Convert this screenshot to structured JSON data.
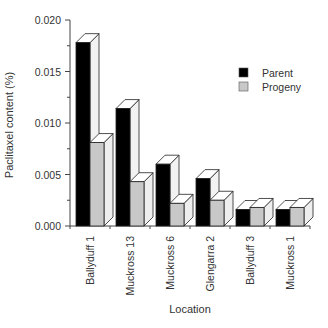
{
  "chart_data": {
    "type": "bar",
    "title": "",
    "xlabel": "Location",
    "ylabel": "Paclitaxel content (%)",
    "ylim": [
      0.0,
      0.02
    ],
    "yticks": [
      "0.000",
      "0.005",
      "0.010",
      "0.015",
      "0.020"
    ],
    "ytick_values": [
      0.0,
      0.005,
      0.01,
      0.015,
      0.02
    ],
    "grid": false,
    "style": "3d-bar",
    "legend_position": "upper right",
    "categories": [
      "Ballyduff 1",
      "Muckross 13",
      "Muckross 6",
      "Glengarra 2",
      "Ballyduff 3",
      "Muckross 1"
    ],
    "series": [
      {
        "name": "Parent",
        "color": "#000000",
        "values": [
          0.0178,
          0.0114,
          0.006,
          0.0046,
          0.0016,
          0.0016
        ]
      },
      {
        "name": "Progeny",
        "color": "#c8c8c8",
        "values": [
          0.0081,
          0.0043,
          0.0022,
          0.0025,
          0.0018,
          0.0018
        ]
      }
    ]
  },
  "legend": {
    "items": [
      {
        "label": "Parent",
        "color": "#000000"
      },
      {
        "label": "Progeny",
        "color": "#c8c8c8"
      }
    ]
  }
}
